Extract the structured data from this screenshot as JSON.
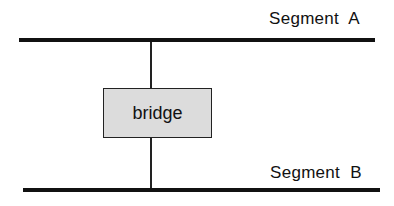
{
  "diagram": {
    "segments": [
      {
        "id": "A",
        "label": "Segment  A"
      },
      {
        "id": "B",
        "label": "Segment  B"
      }
    ],
    "bridge": {
      "label": "bridge"
    },
    "colors": {
      "line": "#111111",
      "box_fill": "#dcdcdc"
    }
  }
}
